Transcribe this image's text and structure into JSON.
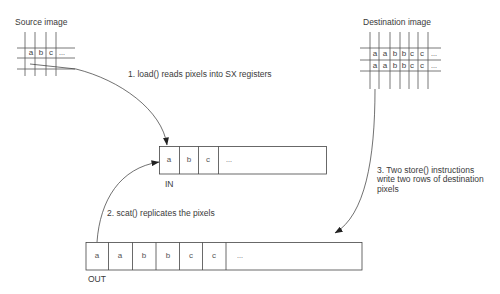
{
  "source": {
    "title": "Source image",
    "cells": [
      "a",
      "b",
      "c",
      "..."
    ]
  },
  "destination": {
    "title": "Destination image",
    "rows": [
      [
        "a",
        "a",
        "b",
        "b",
        "c",
        "c",
        "..."
      ],
      [
        "a",
        "a",
        "b",
        "b",
        "c",
        "c",
        "..."
      ]
    ]
  },
  "in_register": {
    "label": "IN",
    "cells": [
      "a",
      "b",
      "c",
      "..."
    ]
  },
  "out_register": {
    "label": "OUT",
    "cells": [
      "a",
      "a",
      "b",
      "b",
      "c",
      "c",
      "..."
    ]
  },
  "steps": {
    "step1": "1. load() reads pixels into SX registers",
    "step2": "2. scat() replicates the pixels",
    "step3_lines": [
      "3. Two store() instructions",
      "write two rows of destination",
      "pixels"
    ]
  },
  "colors": {
    "line": "#444444",
    "text": "#3a3a3a",
    "background": "#ffffff"
  }
}
